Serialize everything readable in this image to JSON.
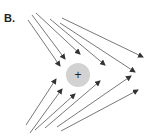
{
  "panel_label": "B.",
  "charge": {
    "symbol": "+",
    "cx": 78,
    "cy": 75,
    "r": 12,
    "fill": "#d2d2d2"
  },
  "colors": {
    "line": "#555555"
  },
  "arrows": [
    {
      "x1": 28,
      "y1": 20,
      "x2": 60,
      "y2": 66
    },
    {
      "x1": 32,
      "y1": 15,
      "x2": 65,
      "y2": 59
    },
    {
      "x1": 36,
      "y1": 13,
      "x2": 80,
      "y2": 54
    },
    {
      "x1": 50,
      "y1": 19,
      "x2": 105,
      "y2": 65
    },
    {
      "x1": 60,
      "y1": 23,
      "x2": 135,
      "y2": 72
    },
    {
      "x1": 62,
      "y1": 18,
      "x2": 143,
      "y2": 57
    },
    {
      "x1": 26,
      "y1": 125,
      "x2": 56,
      "y2": 79
    },
    {
      "x1": 30,
      "y1": 133,
      "x2": 62,
      "y2": 89
    },
    {
      "x1": 35,
      "y1": 130,
      "x2": 75,
      "y2": 94
    },
    {
      "x1": 45,
      "y1": 128,
      "x2": 100,
      "y2": 81
    },
    {
      "x1": 57,
      "y1": 127,
      "x2": 131,
      "y2": 76
    },
    {
      "x1": 61,
      "y1": 131,
      "x2": 138,
      "y2": 90
    }
  ]
}
